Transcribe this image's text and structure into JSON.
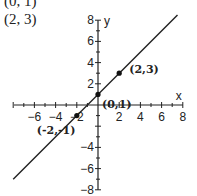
{
  "header": {
    "line1": "(0, 1)",
    "line2": "(2, 3)"
  },
  "chart_data": {
    "type": "line",
    "title": "",
    "xlabel": "x",
    "ylabel": "y",
    "xlim": [
      -8,
      8
    ],
    "ylim": [
      -8,
      8
    ],
    "x_ticks": [
      -6,
      -4,
      -2,
      2,
      4,
      6,
      8
    ],
    "y_ticks": [
      8,
      6,
      4,
      2,
      -4,
      -6,
      -8
    ],
    "grid": false,
    "series": [
      {
        "name": "y = x + 1",
        "x": [
          -8,
          7.5
        ],
        "y": [
          -7,
          8.5
        ]
      }
    ],
    "points": [
      {
        "x": -2,
        "y": -1,
        "label": "(-2,-1)"
      },
      {
        "x": 0,
        "y": 1,
        "label": "(0,1)"
      },
      {
        "x": 2,
        "y": 3,
        "label": "(2,3)"
      }
    ]
  }
}
